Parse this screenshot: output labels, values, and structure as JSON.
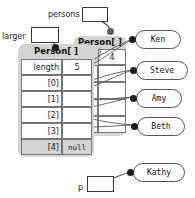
{
  "diagram": {
    "type": "object-reference-diagram"
  },
  "variables": [
    {
      "id": "larger",
      "label": "larger",
      "value": ""
    },
    {
      "id": "persons",
      "label": "persons",
      "value": ""
    },
    {
      "id": "p",
      "label": "p",
      "value": ""
    }
  ],
  "arrays": [
    {
      "id": "front-array",
      "header": "Person[ ]",
      "rows": [
        {
          "label": "length",
          "value": "5"
        },
        {
          "label": "[0]",
          "value": ""
        },
        {
          "label": "[1]",
          "value": ""
        },
        {
          "label": "[2]",
          "value": ""
        },
        {
          "label": "[3]",
          "value": ""
        },
        {
          "label": "[4]",
          "value": "null"
        }
      ]
    },
    {
      "id": "back-array",
      "header": "Person[ ]",
      "rows": [
        {
          "label": "length",
          "value": "4"
        },
        {
          "label": "[0]",
          "value": ""
        },
        {
          "label": "[1]",
          "value": ""
        },
        {
          "label": "[2]",
          "value": ""
        },
        {
          "label": "[3]",
          "value": ""
        }
      ]
    }
  ],
  "objects": [
    {
      "id": "ken",
      "name": "Ken"
    },
    {
      "id": "steve",
      "name": "Steve"
    },
    {
      "id": "amy",
      "name": "Amy"
    },
    {
      "id": "beth",
      "name": "Beth"
    },
    {
      "id": "kathy",
      "name": "Kathy"
    }
  ],
  "colors": {
    "array_fill": "#d4d4d4",
    "cell_fill": "#ffffff",
    "stroke": "#555555",
    "dot": "#1d1d1d",
    "text": "#111111"
  }
}
